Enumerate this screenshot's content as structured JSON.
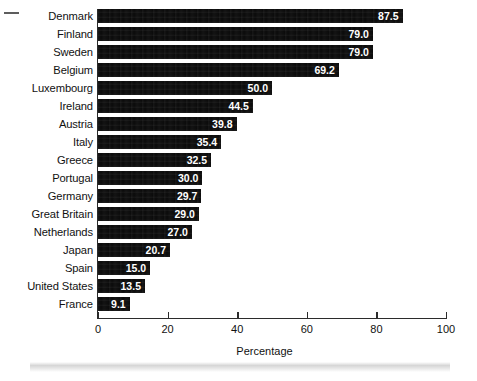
{
  "chart_data": {
    "type": "bar",
    "orientation": "horizontal",
    "title": "",
    "xlabel": "Percentage",
    "ylabel": "",
    "xlim": [
      0,
      100
    ],
    "xticks": [
      0,
      20,
      40,
      60,
      80,
      100
    ],
    "xticklabels": [
      "0",
      "20",
      "40",
      "60",
      "80",
      "100"
    ],
    "grid": false,
    "legend": null,
    "bar_color": "#0b0b0b",
    "value_label_color": "#ffffff",
    "categories": [
      "Denmark",
      "Finland",
      "Sweden",
      "Belgium",
      "Luxembourg",
      "Ireland",
      "Austria",
      "Italy",
      "Greece",
      "Portugal",
      "Germany",
      "Great Britain",
      "Netherlands",
      "Japan",
      "Spain",
      "United States",
      "France"
    ],
    "values": [
      87.5,
      79.0,
      79.0,
      69.2,
      50.0,
      44.5,
      39.8,
      35.4,
      32.5,
      30.0,
      29.7,
      29.0,
      27.0,
      20.7,
      15.0,
      13.5,
      9.1
    ],
    "value_labels": [
      "87.5",
      "79.0",
      "79.0",
      "69.2",
      "50.0",
      "44.5",
      "39.8",
      "35.4",
      "32.5",
      "30.0",
      "29.7",
      "29.0",
      "27.0",
      "20.7",
      "15.0",
      "13.5",
      "9.1"
    ]
  }
}
